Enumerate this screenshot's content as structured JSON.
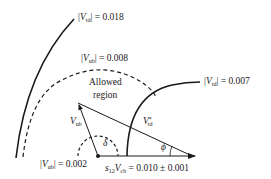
{
  "diagram": {
    "type": "unitarity-triangle-constraint",
    "colors": {
      "stroke": "#1a1a1a",
      "background": "#ffffff"
    },
    "labels": {
      "vtd_outer": {
        "var": "V",
        "sub": "td",
        "value": "= 0.018"
      },
      "vub_outer": {
        "var": "V",
        "sub": "ub",
        "value": "= 0.008"
      },
      "vtd_inner": {
        "var": "V",
        "sub": "td",
        "value": "= 0.007"
      },
      "vub_inner": {
        "var": "V",
        "sub": "ub",
        "value": "= 0.002"
      },
      "allowed_line1": "Allowed",
      "allowed_line2": "region",
      "vub_vector": {
        "var": "V",
        "sub": "ub"
      },
      "vtd_vector": {
        "var": "V",
        "sup": "*",
        "sub": "td"
      },
      "delta": "δ",
      "phi": "ϕ",
      "base": {
        "var1": "s",
        "sub1": "12",
        "var2": "V",
        "sub2": "cb",
        "value": "= 0.010 ± 0.001"
      }
    },
    "elements": [
      {
        "name": "vtd-outer-arc",
        "style": "solid",
        "value": 0.018
      },
      {
        "name": "vub-outer-arc",
        "style": "dashed",
        "value": 0.008
      },
      {
        "name": "vtd-inner-arc",
        "style": "solid",
        "value": 0.007
      },
      {
        "name": "vub-inner-arc",
        "style": "dashed",
        "value": 0.002
      },
      {
        "name": "vub-vector",
        "style": "arrow"
      },
      {
        "name": "vtd-vector",
        "style": "line"
      },
      {
        "name": "base-vector",
        "style": "arrow"
      }
    ]
  }
}
